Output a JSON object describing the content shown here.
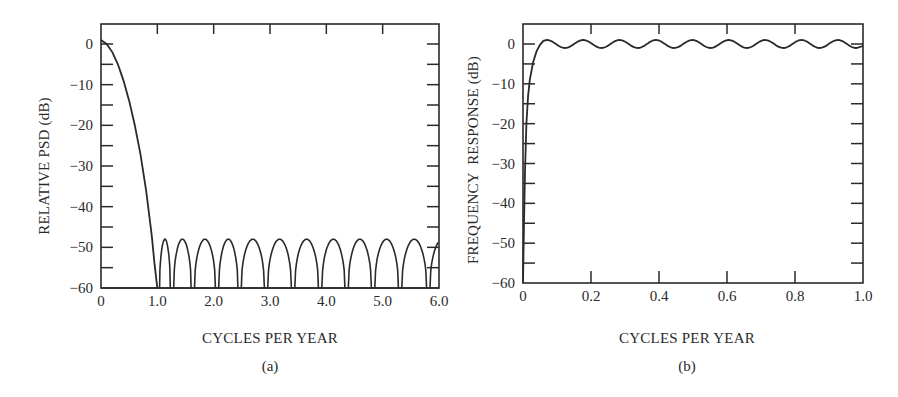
{
  "colors": {
    "line": "#2a2a2a",
    "frame": "#2a2a2a",
    "background": "#ffffff"
  },
  "chart_data": [
    {
      "id": "a",
      "type": "line",
      "caption": "(a)",
      "title": "",
      "xlabel": "CYCLES PER YEAR",
      "ylabel": "RELATIVE PSD (dB)",
      "xlim": [
        0,
        6.0
      ],
      "ylim": [
        -60,
        5
      ],
      "xticks": [
        0,
        1.0,
        2.0,
        3.0,
        4.0,
        5.0,
        6.0
      ],
      "xtick_labels": [
        "0",
        "1.0",
        "2.0",
        "3.0",
        "4.0",
        "5.0",
        "6.0"
      ],
      "yticks": [
        0,
        -10,
        -20,
        -30,
        -40,
        -50,
        -60
      ],
      "ytick_labels": [
        "0",
        "−10",
        "−20",
        "−30",
        "−40",
        "−50",
        "−60"
      ],
      "grid": false,
      "series": [
        {
          "name": "relative PSD",
          "description": "Main lobe from 0 dB at 0 falling to -60 dB floor at 1.0 cycle/yr; sidelobes peaking near -48 dB between nulls",
          "x": [
            0,
            0.1,
            0.2,
            0.3,
            0.4,
            0.5,
            0.6,
            0.7,
            0.8,
            0.9,
            0.95,
            1.0
          ],
          "y": [
            1,
            0,
            -2,
            -5,
            -9,
            -14,
            -20,
            -27,
            -36,
            -47,
            -54,
            -60
          ],
          "sidelobe_peak_db": -48,
          "sidelobe_nulls": [
            1.0,
            1.25,
            1.62,
            2.05,
            2.45,
            2.92,
            3.4,
            3.88,
            4.35,
            4.82,
            5.3,
            5.8
          ],
          "sidelobe_peaks": [
            1.12,
            1.43,
            1.83,
            2.25,
            2.68,
            3.16,
            3.64,
            4.11,
            4.58,
            5.06,
            5.55,
            6.0
          ]
        }
      ]
    },
    {
      "id": "b",
      "type": "line",
      "caption": "(b)",
      "title": "",
      "xlabel": "CYCLES PER YEAR",
      "ylabel": "FREQUENCY  RESPONSE (dB)",
      "xlim": [
        0,
        1.0
      ],
      "ylim": [
        -60,
        5
      ],
      "xticks": [
        0,
        0.2,
        0.4,
        0.6,
        0.8,
        1.0
      ],
      "xtick_labels": [
        "0",
        "0.2",
        "0.4",
        "0.6",
        "0.8",
        "1.0"
      ],
      "yticks": [
        0,
        -10,
        -20,
        -30,
        -40,
        -50,
        -60
      ],
      "ytick_labels": [
        "0",
        "−10",
        "−20",
        "−30",
        "−40",
        "−50",
        "−60"
      ],
      "grid": false,
      "series": [
        {
          "name": "frequency response",
          "description": "High-pass response rising steeply from below -60 dB at 0 to ~0 dB by 0.06 cycles/yr, then rippling about +/-1 dB",
          "x": [
            0.0,
            0.005,
            0.01,
            0.02,
            0.03,
            0.04,
            0.05,
            0.07,
            0.12,
            0.18,
            0.23,
            0.29,
            0.34,
            0.4,
            0.45,
            0.5,
            0.56,
            0.61,
            0.67,
            0.72,
            0.77,
            0.83,
            0.88,
            0.94,
            0.98,
            1.0
          ],
          "y": [
            -60,
            -35,
            -20,
            -9,
            -4,
            -1.5,
            0,
            1,
            -1,
            1,
            -1,
            1,
            -1,
            1,
            -1,
            1,
            -1,
            1,
            -1,
            1,
            -1,
            1,
            -1,
            1,
            0.5,
            -0.5
          ],
          "ripple_db": 1,
          "ripple_period": 0.107
        }
      ]
    }
  ]
}
